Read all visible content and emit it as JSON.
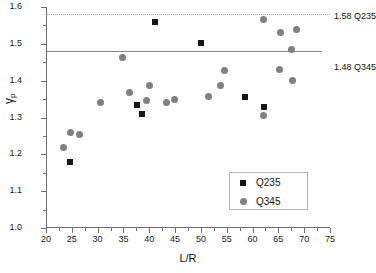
{
  "chart_data": {
    "type": "scatter",
    "title": "",
    "xlabel": "L/R",
    "ylabel": "γ",
    "ylabel_sub": "p",
    "xlim": [
      20,
      75
    ],
    "ylim": [
      1.0,
      1.6
    ],
    "x_ticks": [
      20,
      25,
      30,
      35,
      40,
      45,
      50,
      55,
      60,
      65,
      70,
      75
    ],
    "y_ticks": [
      "1.0",
      "1.1",
      "1.2",
      "1.3",
      "1.4",
      "1.5",
      "1.6"
    ],
    "x_minor_step": 2.5,
    "y_minor_step": 0.05,
    "grid": false,
    "legend_position": "lower right",
    "series": [
      {
        "name": "Q235",
        "marker": "square",
        "color": "#161616",
        "points": [
          [
            24.7,
            1.178
          ],
          [
            37.7,
            1.335
          ],
          [
            38.6,
            1.309
          ],
          [
            41.2,
            1.558
          ],
          [
            50.0,
            1.502
          ],
          [
            58.6,
            1.355
          ],
          [
            62.3,
            1.329
          ]
        ]
      },
      {
        "name": "Q345",
        "marker": "circle",
        "color": "#808080",
        "points": [
          [
            23.4,
            1.218
          ],
          [
            24.8,
            1.259
          ],
          [
            26.4,
            1.254
          ],
          [
            30.5,
            1.342
          ],
          [
            34.8,
            1.462
          ],
          [
            36.1,
            1.367
          ],
          [
            39.5,
            1.345
          ],
          [
            40.1,
            1.388
          ],
          [
            43.4,
            1.342
          ],
          [
            44.8,
            1.349
          ],
          [
            51.4,
            1.357
          ],
          [
            53.7,
            1.387
          ],
          [
            54.5,
            1.428
          ],
          [
            62.1,
            1.306
          ],
          [
            62.1,
            1.565
          ],
          [
            65.3,
            1.43
          ],
          [
            65.4,
            1.531
          ],
          [
            67.6,
            1.484
          ],
          [
            67.8,
            1.4
          ],
          [
            68.5,
            1.539
          ]
        ]
      }
    ],
    "reference_lines": [
      {
        "name": "Q235-limit",
        "value": 1.58,
        "style": "dotted",
        "color": "#a8a8a8",
        "label": "1.58  Q235"
      },
      {
        "name": "Q345-limit",
        "value": 1.48,
        "style": "solid",
        "color": "#888888",
        "label": "1.48  Q345"
      }
    ]
  },
  "legend": {
    "entries": [
      {
        "label": "Q235",
        "marker": "square"
      },
      {
        "label": "Q345",
        "marker": "circle"
      }
    ]
  },
  "annotations": {
    "top_ref_label": "1.58  Q235",
    "bottom_ref_label": "1.48  Q345"
  }
}
